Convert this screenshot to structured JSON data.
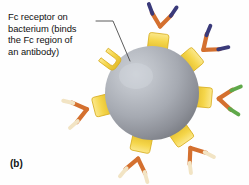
{
  "figure": {
    "panel_label": "(b)",
    "annotation": {
      "name": "fc-receptor-callout",
      "text": "Fc receptor on\nbacterium (binds\nthe Fc region of\nan antibody)",
      "lines": [
        "Fc receptor on",
        "bacterium (binds",
        "the Fc region of",
        "an antibody)"
      ],
      "leader_from": [
        96,
        21
      ],
      "leader_elbow": [
        112,
        21
      ],
      "leader_to": [
        130,
        62
      ]
    },
    "bacterium": {
      "name": "bacterium-sphere",
      "label": "bacterium",
      "center": [
        152,
        93
      ],
      "radius": 47,
      "highlight_color": "#c6cad1",
      "mid_color": "#a4a8b0",
      "edge_color": "#85888f",
      "shade_color": "#74777e"
    },
    "colors": {
      "receptor_fill": "#f5d64b",
      "receptor_light": "#fbe88d",
      "receptor_edge": "#d8ae21",
      "antibody_stem": "#c0562a",
      "antibody_stem_light": "#e08a4a",
      "antibody_arm": "#d4702f",
      "tip_navy": "#3a3a7a",
      "tip_green": "#5fa84a",
      "tip_cream": "#f2e4c4",
      "background": "#ffffff",
      "leader_line": "#4a4a4a",
      "text": "#111111"
    },
    "receptors": [
      {
        "name": "receptor-empty-upper-left",
        "angle_deg": 143,
        "occupied": false,
        "tip_color": null,
        "note": "unoccupied U-shaped Fc receptor (target of the callout label)"
      },
      {
        "name": "receptor-antibody-top",
        "angle_deg": 83,
        "occupied": true,
        "tip_color": "#3a3a7a"
      },
      {
        "name": "receptor-antibody-upper-right",
        "angle_deg": 40,
        "occupied": true,
        "tip_color": "#3a3a7a"
      },
      {
        "name": "receptor-antibody-right",
        "angle_deg": 355,
        "occupied": true,
        "tip_color": "#5fa84a"
      },
      {
        "name": "receptor-antibody-lower-right",
        "angle_deg": 305,
        "occupied": true,
        "tip_color": "#f2e4c4"
      },
      {
        "name": "receptor-antibody-bottom",
        "angle_deg": 258,
        "occupied": true,
        "tip_color": "#f2e4c4"
      },
      {
        "name": "receptor-antibody-left",
        "angle_deg": 194,
        "occupied": true,
        "tip_color": "#f2e4c4"
      }
    ]
  }
}
